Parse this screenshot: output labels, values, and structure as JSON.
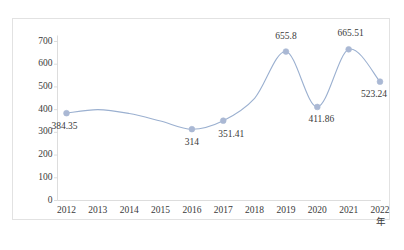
{
  "chart_data": {
    "type": "line",
    "title": "",
    "xlabel": "年",
    "ylabel": "",
    "categories": [
      "2012",
      "2013",
      "2014",
      "2015",
      "2016",
      "2017",
      "2018",
      "2019",
      "2020",
      "2021",
      "2022"
    ],
    "values": [
      384.35,
      400,
      383,
      350,
      314,
      351.41,
      450,
      655.8,
      411.86,
      665.51,
      523.24
    ],
    "point_labels": [
      "384.35",
      "",
      "",
      "",
      "314",
      "351.41",
      "",
      "655.8",
      "411.86",
      "665.51",
      "523.24"
    ],
    "markers": [
      true,
      false,
      false,
      false,
      true,
      true,
      false,
      true,
      true,
      true,
      true
    ],
    "ylim": [
      0,
      700
    ],
    "ytick_values": [
      0,
      100,
      200,
      300,
      400,
      500,
      600,
      700
    ],
    "ytick_labels": [
      "0",
      "100",
      "200",
      "300",
      "400",
      "500",
      "600",
      "700"
    ],
    "grid": false,
    "legend": "none",
    "line_color": "#9bb0d0",
    "marker_color": "#aab8d4",
    "axis_color": "#d9d9d9",
    "text_color": "#3a3a3a",
    "smoothing": "spline"
  },
  "caption": "",
  "frame": {
    "border_color": "#e2e2e2"
  }
}
